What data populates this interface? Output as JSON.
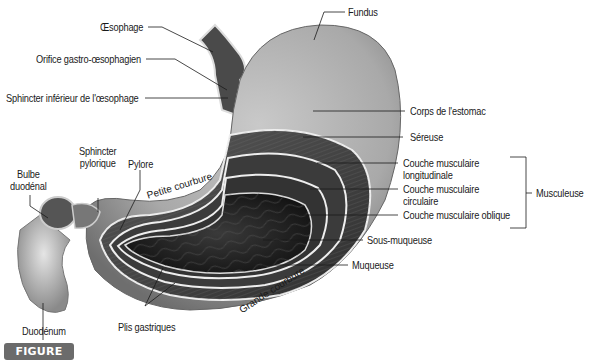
{
  "figure": {
    "badge_prefix": "FIGURE",
    "badge_number": "53.2",
    "badge_color": "#6b6b6b"
  },
  "labels": {
    "oesophage": "Œsophage",
    "orifice": "Orifice gastro-œsophagien",
    "sphincter_inferieur": "Sphincter inférieur de l'œsophage",
    "fundus": "Fundus",
    "corps": "Corps de l'estomac",
    "sereuse": "Séreuse",
    "couche_longitudinale_1": "Couche musculaire",
    "couche_longitudinale_2": "longitudinale",
    "couche_circulaire_1": "Couche musculaire",
    "couche_circulaire_2": "circulaire",
    "couche_oblique": "Couche musculaire oblique",
    "musculeuse": "Musculeuse",
    "sous_muqueuse": "Sous-muqueuse",
    "muqueuse": "Muqueuse",
    "sphincter_pylorique_1": "Sphincter",
    "sphincter_pylorique_2": "pylorique",
    "pylore": "Pylore",
    "bulbe_1": "Bulbe",
    "bulbe_2": "duodénal",
    "petite_courbure": "Petite courbure",
    "grande_courbure": "Grande courbure",
    "plis_gastriques": "Plis gastriques",
    "duodenum": "Duodénum"
  }
}
